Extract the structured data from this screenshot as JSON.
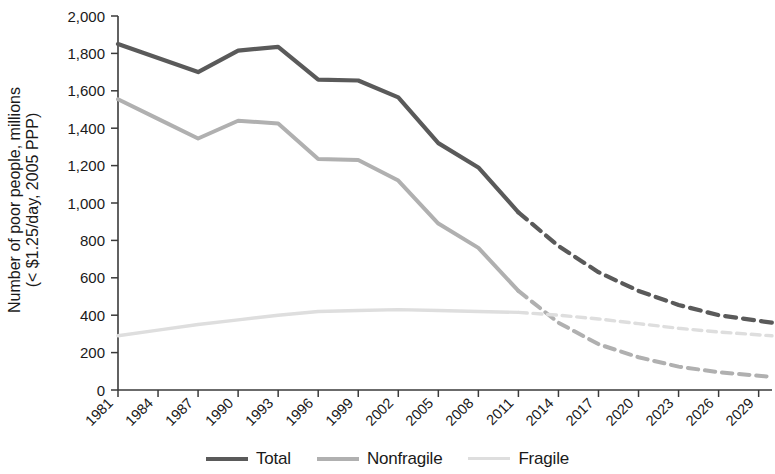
{
  "chart_data": {
    "type": "line",
    "title": "",
    "xlabel": "",
    "ylabel": "Number of poor people, millions (< $1.25/day, 2005 PPP)",
    "ylabel_line1": "Number of poor people, millions",
    "ylabel_line2": "(< $1.25/day, 2005 PPP)",
    "ylim": [
      0,
      2000
    ],
    "xlim": [
      1981,
      2030
    ],
    "grid": false,
    "legend_position": "bottom-center",
    "y_ticks": [
      0,
      200,
      400,
      600,
      800,
      1000,
      1200,
      1400,
      1600,
      1800,
      2000
    ],
    "y_tick_labels": [
      "0",
      "200",
      "400",
      "600",
      "800",
      "1,000",
      "1,200",
      "1,400",
      "1,600",
      "1,800",
      "2,000"
    ],
    "x_ticks": [
      1981,
      1984,
      1987,
      1990,
      1993,
      1996,
      1999,
      2002,
      2005,
      2008,
      2011,
      2014,
      2017,
      2020,
      2023,
      2026,
      2029
    ],
    "x_tick_labels": [
      "1981",
      "1984",
      "1987",
      "1990",
      "1993",
      "1996",
      "1999",
      "2002",
      "2005",
      "2008",
      "2011",
      "2014",
      "2017",
      "2020",
      "2023",
      "2026",
      "2029"
    ],
    "projection_starts": 2011,
    "series": [
      {
        "name": "Total",
        "color": "#5a5a5a",
        "width": 4.2,
        "x": [
          1981,
          1984,
          1987,
          1990,
          1993,
          1996,
          1999,
          2002,
          2005,
          2008,
          2011,
          2014,
          2017,
          2020,
          2023,
          2026,
          2030
        ],
        "values": [
          1850,
          1775,
          1700,
          1815,
          1835,
          1660,
          1655,
          1565,
          1320,
          1190,
          950,
          770,
          630,
          530,
          455,
          400,
          360
        ]
      },
      {
        "name": "Nonfragile",
        "color": "#b0b0b0",
        "width": 4.0,
        "x": [
          1981,
          1984,
          1987,
          1990,
          1993,
          1996,
          1999,
          2002,
          2005,
          2008,
          2011,
          2014,
          2017,
          2020,
          2023,
          2026,
          2030
        ],
        "values": [
          1555,
          1450,
          1345,
          1440,
          1425,
          1235,
          1230,
          1120,
          890,
          760,
          530,
          360,
          245,
          175,
          125,
          95,
          70
        ]
      },
      {
        "name": "Fragile",
        "color": "#dedede",
        "width": 3.4,
        "x": [
          1981,
          1984,
          1987,
          1990,
          1993,
          1996,
          1999,
          2002,
          2005,
          2008,
          2011,
          2014,
          2017,
          2020,
          2023,
          2026,
          2030
        ],
        "values": [
          290,
          320,
          350,
          375,
          400,
          420,
          425,
          430,
          425,
          420,
          415,
          400,
          380,
          355,
          330,
          310,
          290
        ]
      }
    ]
  },
  "legend": {
    "items": [
      {
        "label": "Total",
        "color": "#5a5a5a",
        "width": 4.2
      },
      {
        "label": "Nonfragile",
        "color": "#b0b0b0",
        "width": 4.0
      },
      {
        "label": "Fragile",
        "color": "#dedede",
        "width": 3.4
      }
    ]
  }
}
